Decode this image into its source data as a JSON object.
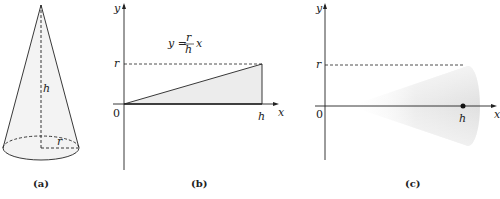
{
  "figure": {
    "panel_a": {
      "caption": "(a)",
      "height_label": "h",
      "radius_label": "r"
    },
    "panel_b": {
      "caption": "(b)",
      "y_axis_label": "y",
      "x_axis_label": "x",
      "origin_label": "0",
      "r_tick_label": "r",
      "h_tick_label": "h",
      "equation": {
        "lhs": "y =",
        "numerator": "r",
        "denominator": "h",
        "variable": "x"
      }
    },
    "panel_c": {
      "caption": "(c)",
      "y_axis_label": "y",
      "x_axis_label": "x",
      "origin_label": "0",
      "r_tick_label": "r",
      "h_tick_label": "h"
    }
  },
  "colors": {
    "stroke": "#222222",
    "fill_light": "#ececec",
    "cone_shade": "#e2e2e2"
  }
}
